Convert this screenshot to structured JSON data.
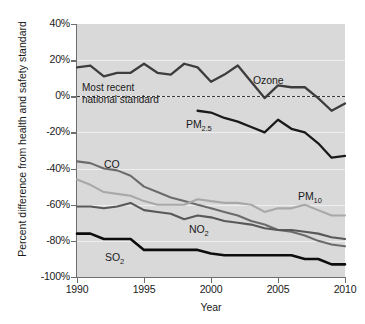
{
  "chart_data": {
    "type": "line",
    "title": "",
    "xlabel": "Year",
    "ylabel": "Percent difference from health and safety standard",
    "xlim": [
      1990,
      2010
    ],
    "ylim": [
      -100,
      40
    ],
    "grid": true,
    "legend_position": "inline-labels",
    "y_ticks": [
      "40%",
      "20%",
      "0%",
      "-20%",
      "-40%",
      "-60%",
      "-80%",
      "-100%"
    ],
    "y_tick_values": [
      40,
      20,
      0,
      -20,
      -40,
      -60,
      -80,
      -100
    ],
    "x_ticks": [
      "1990",
      "1995",
      "2000",
      "2005",
      "2010"
    ],
    "x_tick_values": [
      1990,
      1995,
      2000,
      2005,
      2010
    ],
    "reference_line": {
      "value": 0,
      "style": "dashed",
      "label_line1": "Most recent",
      "label_line2": "national standard"
    },
    "series": [
      {
        "name": "Ozone",
        "color": "#3d3d3d",
        "width": 2.3,
        "x": [
          1990,
          1991,
          1992,
          1993,
          1994,
          1995,
          1996,
          1997,
          1998,
          1999,
          2000,
          2001,
          2002,
          2003,
          2004,
          2005,
          2006,
          2007,
          2008,
          2009,
          2010
        ],
        "values": [
          16,
          17,
          11,
          13,
          13,
          18,
          13,
          12,
          18,
          16,
          8,
          12,
          17,
          8,
          -1,
          6,
          5,
          5,
          -1,
          -8,
          -4
        ]
      },
      {
        "name": "PM2.5",
        "color": "#1a1a1a",
        "width": 2.3,
        "x": [
          1999,
          2000,
          2001,
          2002,
          2003,
          2004,
          2005,
          2006,
          2007,
          2008,
          2009,
          2010
        ],
        "values": [
          -8,
          -9,
          -12,
          -14,
          -17,
          -20,
          -13,
          -18,
          -20,
          -26,
          -34,
          -33
        ]
      },
      {
        "name": "CO",
        "color": "#6b6b6b",
        "width": 2.1,
        "x": [
          1990,
          1991,
          1992,
          1993,
          1994,
          1995,
          1996,
          1997,
          1998,
          1999,
          2000,
          2001,
          2002,
          2003,
          2004,
          2005,
          2006,
          2007,
          2008,
          2009,
          2010
        ],
        "values": [
          -36,
          -37,
          -40,
          -41,
          -44,
          -50,
          -53,
          -56,
          -58,
          -60,
          -62,
          -64,
          -66,
          -69,
          -71,
          -74,
          -75,
          -77,
          -80,
          -82,
          -83
        ]
      },
      {
        "name": "PM10",
        "color": "#a8a8a8",
        "width": 2.1,
        "x": [
          1990,
          1991,
          1992,
          1993,
          1994,
          1995,
          1996,
          1997,
          1998,
          1999,
          2000,
          2001,
          2002,
          2003,
          2004,
          2005,
          2006,
          2007,
          2008,
          2009,
          2010
        ],
        "values": [
          -46,
          -49,
          -53,
          -54,
          -55,
          -58,
          -60,
          -60,
          -60,
          -57,
          -58,
          -59,
          -59,
          -60,
          -64,
          -62,
          -62,
          -60,
          -63,
          -66,
          -66
        ]
      },
      {
        "name": "NO2",
        "color": "#585858",
        "width": 2.1,
        "x": [
          1990,
          1991,
          1992,
          1993,
          1994,
          1995,
          1996,
          1997,
          1998,
          1999,
          2000,
          2001,
          2002,
          2003,
          2004,
          2005,
          2006,
          2007,
          2008,
          2009,
          2010
        ],
        "values": [
          -61,
          -61,
          -62,
          -61,
          -59,
          -63,
          -64,
          -65,
          -68,
          -66,
          -67,
          -69,
          -70,
          -71,
          -73,
          -74,
          -74,
          -75,
          -76,
          -78,
          -79
        ]
      },
      {
        "name": "SO2",
        "color": "#0d0d0d",
        "width": 2.6,
        "x": [
          1990,
          1991,
          1992,
          1993,
          1994,
          1995,
          1996,
          1997,
          1998,
          1999,
          2000,
          2001,
          2002,
          2003,
          2004,
          2005,
          2006,
          2007,
          2008,
          2009,
          2010
        ],
        "values": [
          -76,
          -76,
          -79,
          -79,
          -79,
          -85,
          -85,
          -85,
          -85,
          -85,
          -87,
          -88,
          -88,
          -88,
          -88,
          -88,
          -88,
          -90,
          -90,
          -93,
          -93
        ]
      }
    ],
    "series_labels": [
      {
        "name": "Ozone",
        "text": "Ozone",
        "sub": ""
      },
      {
        "name": "PM2.5",
        "text": "PM",
        "sub": "2.5"
      },
      {
        "name": "CO",
        "text": "CO",
        "sub": ""
      },
      {
        "name": "PM10",
        "text": "PM",
        "sub": "10"
      },
      {
        "name": "NO2",
        "text": "NO",
        "sub": "2"
      },
      {
        "name": "SO2",
        "text": "SO",
        "sub": "2"
      }
    ]
  },
  "label_positions": {
    "Ozone": {
      "x": 253,
      "y": 74
    },
    "PM2.5": {
      "x": 186,
      "y": 118
    },
    "CO": {
      "x": 104,
      "y": 158
    },
    "PM10": {
      "x": 298,
      "y": 190
    },
    "NO2": {
      "x": 189,
      "y": 223
    },
    "SO2": {
      "x": 105,
      "y": 251
    }
  },
  "annotation_position": {
    "x": 82,
    "y": 82
  }
}
